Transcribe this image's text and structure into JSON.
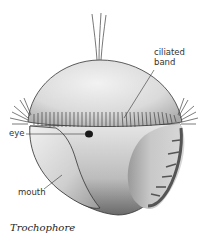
{
  "figure": {
    "title": "Trochophore"
  },
  "labels": {
    "ciliated_band_line1": "ciliated",
    "ciliated_band_line2": "band",
    "eye": "eye",
    "mouth": "mouth"
  },
  "caption": "Trochophore",
  "colors": {
    "body_light": "#ececec",
    "body_mid": "#bdbdbd",
    "body_dark": "#5a5a5a",
    "line": "#333333",
    "cilia": "#444444",
    "eye": "#1a1a1a"
  }
}
